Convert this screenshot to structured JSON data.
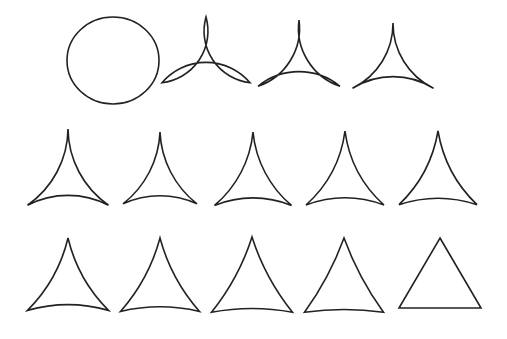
{
  "figure": {
    "stroke_color": "#222222",
    "fill_color": "#ffffff",
    "background": "#ffffff"
  },
  "rows": [
    {
      "shapes": [
        {
          "cx": 113,
          "top": 17,
          "bottom": 104,
          "half_width": 46,
          "bulge": 1.0,
          "kind": "circle"
        },
        {
          "cx": 206,
          "top": 17,
          "bottom": 103,
          "half_width": 44,
          "bulge": 0.8,
          "kind": "curved-triangle"
        },
        {
          "cx": 299,
          "top": 20,
          "bottom": 101,
          "half_width": 41,
          "bulge": 0.62,
          "kind": "curved-triangle"
        },
        {
          "cx": 393,
          "top": 23,
          "bottom": 100,
          "half_width": 40.5,
          "bulge": 0.5,
          "kind": "curved-triangle"
        }
      ]
    },
    {
      "shapes": [
        {
          "cx": 68,
          "top": 129,
          "bottom": 215,
          "half_width": 40.5,
          "bulge": 0.42,
          "kind": "curved-triangle"
        },
        {
          "cx": 160,
          "top": 132,
          "bottom": 212,
          "half_width": 37,
          "bulge": 0.38,
          "kind": "curved-triangle"
        },
        {
          "cx": 253,
          "top": 132,
          "bottom": 213,
          "half_width": 38.5,
          "bulge": 0.34,
          "kind": "curved-triangle"
        },
        {
          "cx": 345,
          "top": 131,
          "bottom": 212,
          "half_width": 39,
          "bulge": 0.31,
          "kind": "curved-triangle"
        },
        {
          "cx": 438,
          "top": 131,
          "bottom": 211,
          "half_width": 39,
          "bulge": 0.28,
          "kind": "curved-triangle"
        }
      ]
    },
    {
      "shapes": [
        {
          "cx": 68,
          "top": 238,
          "bottom": 316,
          "half_width": 40.5,
          "bulge": 0.24,
          "kind": "curved-triangle"
        },
        {
          "cx": 160,
          "top": 238,
          "bottom": 316,
          "half_width": 39.5,
          "bulge": 0.2,
          "kind": "curved-triangle"
        },
        {
          "cx": 252,
          "top": 237,
          "bottom": 316,
          "half_width": 40.5,
          "bulge": 0.16,
          "kind": "curved-triangle"
        },
        {
          "cx": 344,
          "top": 238,
          "bottom": 315,
          "half_width": 39.5,
          "bulge": 0.12,
          "kind": "curved-triangle"
        },
        {
          "cx": 440,
          "top": 238,
          "bottom": 308,
          "half_width": 41,
          "bulge": 0.0,
          "kind": "triangle"
        }
      ]
    }
  ]
}
